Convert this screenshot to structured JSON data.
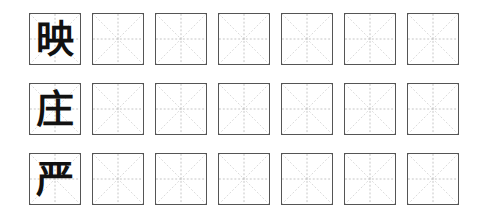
{
  "worksheet": {
    "type": "tianzige-mizige-practice-grid",
    "rows": [
      {
        "character": "映",
        "blank_cells": 6
      },
      {
        "character": "庄",
        "blank_cells": 6
      },
      {
        "character": "严",
        "blank_cells": 6
      }
    ],
    "colors": {
      "border": "#555555",
      "guide_lines": "#b5b5b5",
      "character": "#111111",
      "background": "#ffffff"
    }
  }
}
